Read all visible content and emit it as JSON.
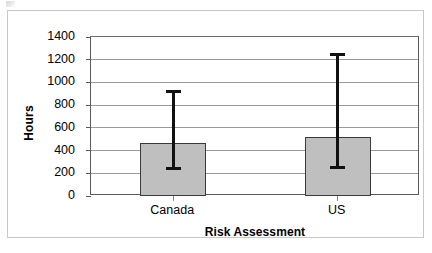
{
  "chart_data": {
    "type": "bar",
    "title": "",
    "xlabel": "Risk Assessment",
    "ylabel": "Hours",
    "categories": [
      "Canada",
      "US"
    ],
    "values": [
      465,
      520
    ],
    "error_bars": {
      "upper": [
        935,
        1260
      ],
      "lower": [
        230,
        240
      ]
    },
    "ylim": [
      0,
      1400
    ],
    "ytick_labels": [
      "1400",
      "1200",
      "1000",
      "800",
      "600",
      "400",
      "200",
      "0"
    ],
    "ytick_values": [
      1400,
      1200,
      1000,
      800,
      600,
      400,
      200,
      0
    ],
    "grid": true,
    "legend": "none",
    "bar_color": "#bfbfbf",
    "bar_border_color": "#3a3a3a",
    "error_bar_color": "#111111",
    "gridline_color": "#9a9a9a",
    "axis_color": "#5a5a5a",
    "frame_color": "#c8c8c8",
    "background_color": "#ffffff"
  }
}
